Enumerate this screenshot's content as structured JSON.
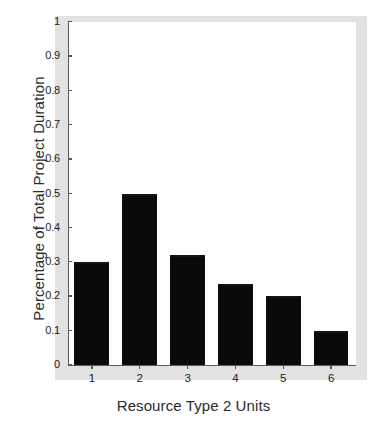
{
  "chart_data": {
    "type": "bar",
    "title": "",
    "subtitle": "",
    "xlabel": "Resource Type 2 Units",
    "ylabel": "Percentage of Total Project Duration",
    "categories": [
      "1",
      "2",
      "3",
      "4",
      "5",
      "6"
    ],
    "values": [
      0.3,
      0.5,
      0.32,
      0.235,
      0.2,
      0.1
    ],
    "ylim": [
      0,
      1
    ],
    "xlim_categories": 6,
    "ytick_labels": [
      "0",
      "0.1",
      "0.2",
      "0.3",
      "0.4",
      "0.5",
      "0.6",
      "0.7",
      "0.8",
      "0.9",
      "1"
    ],
    "ytick_values": [
      0,
      0.1,
      0.2,
      0.3,
      0.4,
      0.5,
      0.6,
      0.7,
      0.8,
      0.9,
      1
    ],
    "xtick_labels": [
      "1",
      "2",
      "3",
      "4",
      "5",
      "6"
    ],
    "grid": false,
    "legend": null,
    "legend_position": "none",
    "annotations": [],
    "bar_color": "#0a0a0a",
    "axis_color": "#5a5a5a",
    "frame_color": "#e2e2e2",
    "background_color": "#ffffff"
  }
}
